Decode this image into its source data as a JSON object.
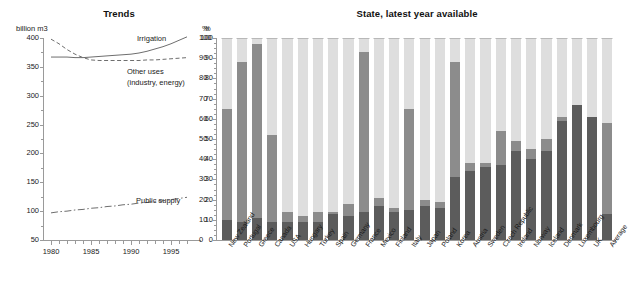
{
  "figure": {
    "background": "#ffffff"
  },
  "charts": [
    {
      "id": "trends",
      "title": "Trends",
      "ylabel": "billion m3",
      "xlabel": "",
      "y_ticks": [
        "400",
        "350",
        "300",
        "250",
        "200",
        "150",
        "100",
        "50"
      ],
      "y_tick_values": [
        400,
        350,
        300,
        250,
        200,
        150,
        100,
        50
      ],
      "x_ticks": [
        "1980",
        "1985",
        "1990",
        "1995"
      ],
      "x_tick_values": [
        1980,
        1985,
        1990,
        1995
      ],
      "series_labels": [
        "Irrigation",
        "Other uses",
        "(industry, energy)",
        "Public supply"
      ]
    },
    {
      "id": "state",
      "title": "State, latest year available",
      "ylabel": "%",
      "y_ticks": [
        "100",
        "90",
        "80",
        "70",
        "60",
        "50",
        "40",
        "30",
        "20",
        "10",
        "0"
      ]
    }
  ],
  "chart_data": [
    {
      "type": "line",
      "id": "trends",
      "title": "Trends",
      "xlabel": "",
      "ylabel": "billion m3",
      "ylabel_right": "%",
      "xlim": [
        1979,
        1998
      ],
      "ylim": [
        50,
        420
      ],
      "ylim_right": [
        0,
        105
      ],
      "grid": false,
      "legend": "inline-annotations",
      "x": [
        1980,
        1981,
        1982,
        1983,
        1984,
        1985,
        1986,
        1987,
        1988,
        1989,
        1990,
        1991,
        1992,
        1993,
        1994,
        1995,
        1996,
        1997
      ],
      "series": [
        {
          "name": "Irrigation",
          "style": "solid",
          "color": "#6e6e6e",
          "values": [
            367,
            367,
            367,
            366,
            366,
            367,
            368,
            369,
            370,
            371,
            372,
            374,
            377,
            381,
            385,
            390,
            396,
            402
          ]
        },
        {
          "name": "Other uses (industry, energy)",
          "style": "dashed",
          "color": "#6e6e6e",
          "values": [
            398,
            390,
            380,
            372,
            366,
            362,
            361,
            361,
            361,
            361,
            361,
            361,
            362,
            362,
            363,
            364,
            365,
            366
          ]
        },
        {
          "name": "Public supply",
          "style": "dash-dot",
          "color": "#6e6e6e",
          "values": [
            97,
            99,
            100,
            102,
            103,
            105,
            106,
            108,
            109,
            111,
            112,
            114,
            115,
            117,
            118,
            120,
            122,
            124
          ]
        }
      ]
    },
    {
      "type": "bar",
      "subtype": "stacked",
      "id": "state",
      "title": "State, latest year available",
      "xlabel": "",
      "ylabel": "%",
      "ylim": [
        0,
        100
      ],
      "y_ticks": [
        0,
        10,
        20,
        30,
        40,
        50,
        60,
        70,
        80,
        90,
        100
      ],
      "grid": false,
      "legend": "none",
      "stack_order_bottom_to_top": [
        "dark",
        "medium",
        "light"
      ],
      "segment_colors": {
        "dark": "#5c5c5c",
        "medium": "#8c8c8c",
        "light": "#dedede"
      },
      "categories": [
        "New Zealand",
        "Portugal",
        "Greece",
        "Canada",
        "USA",
        "Hungary",
        "Turkey",
        "Spain",
        "Germany",
        "France",
        "Mexico",
        "Finland",
        "Italy",
        "Japan",
        "Poland",
        "Korea",
        "Austria",
        "Sweden",
        "Czech Republic",
        "Ireland",
        "Norway",
        "Iceland",
        "Denmark",
        "Luxembourg",
        "UK",
        "Average"
      ],
      "series": [
        {
          "name": "dark",
          "color": "#5c5c5c",
          "values": [
            10,
            9,
            11,
            9,
            9,
            9,
            9,
            13,
            12,
            14,
            17,
            14,
            15,
            17,
            16,
            31,
            34,
            36,
            37,
            44,
            40,
            44,
            59,
            67,
            61,
            13
          ]
        },
        {
          "name": "medium",
          "color": "#8c8c8c",
          "values": [
            55,
            79,
            86,
            43,
            5,
            3,
            5,
            1,
            6,
            79,
            4,
            2,
            50,
            3,
            3,
            57,
            4,
            2,
            17,
            5,
            5,
            6,
            2,
            0,
            0,
            45
          ]
        },
        {
          "name": "light",
          "color": "#dedede",
          "values": [
            35,
            12,
            3,
            48,
            86,
            88,
            86,
            86,
            82,
            7,
            79,
            84,
            35,
            80,
            81,
            12,
            62,
            62,
            46,
            51,
            55,
            50,
            39,
            33,
            39,
            42
          ]
        }
      ],
      "cumulative_tops": {
        "dark_plus_medium": [
          65,
          88,
          97,
          52,
          14,
          12,
          14,
          14,
          18,
          93,
          21,
          16,
          65,
          20,
          19,
          88,
          38,
          38,
          54,
          49,
          45,
          50,
          61,
          67,
          61,
          58
        ]
      }
    }
  ]
}
